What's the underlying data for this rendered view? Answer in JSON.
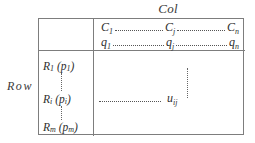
{
  "diagram": {
    "col_caption": "Col",
    "row_caption": "Row",
    "header": {
      "c_row": {
        "first": "C",
        "first_sub": "1",
        "middle": "C",
        "middle_sub": "j",
        "last": "C",
        "last_sub": "n"
      },
      "q_row": {
        "first": "q",
        "first_sub": "1",
        "middle": "q",
        "middle_sub": "j",
        "last": "q",
        "last_sub": "n"
      }
    },
    "row_labels": [
      {
        "name": "R",
        "name_sub": "1",
        "paren_open": "(",
        "p": "p",
        "p_sub": "1",
        "paren_close": ")"
      },
      {
        "name": "R",
        "name_sub": "i",
        "paren_open": "(",
        "p": "p",
        "p_sub": "i",
        "paren_close": ")"
      },
      {
        "name": "R",
        "name_sub": "m",
        "paren_open": "(",
        "p": "p",
        "p_sub": "m",
        "paren_close": ")"
      }
    ],
    "cell": {
      "value": "u",
      "value_sub": "ij"
    },
    "colors": {
      "border": "#7d7d7d",
      "text": "#2e2e2e",
      "caption": "#3a3a3a",
      "dots": "#555555",
      "background": "#ffffff"
    }
  }
}
